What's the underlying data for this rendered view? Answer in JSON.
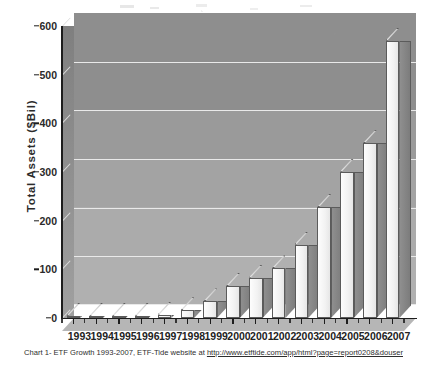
{
  "chart_data": {
    "type": "bar",
    "title": "",
    "xlabel": "",
    "ylabel": "Total Assets ($Bil)",
    "categories": [
      "1993",
      "1994",
      "1995",
      "1996",
      "1997",
      "1998",
      "1999",
      "2000",
      "2001",
      "2002",
      "2003",
      "2004",
      "2005",
      "2006",
      "2007"
    ],
    "values": [
      0.5,
      0.5,
      1,
      2,
      7,
      16,
      34,
      66,
      83,
      102,
      151,
      228,
      301,
      359,
      570
    ],
    "ylim": [
      0,
      600
    ],
    "yticks": [
      0,
      100,
      200,
      300,
      400,
      500,
      600
    ],
    "grid": true,
    "legend": false,
    "style": "3d-column",
    "series": [
      {
        "name": "Total Assets",
        "values": [
          0.5,
          0.5,
          1,
          2,
          7,
          16,
          34,
          66,
          83,
          102,
          151,
          228,
          301,
          359,
          570
        ]
      }
    ]
  },
  "axes": {
    "y_title": "Total Assets ($Bil)",
    "y_tick_labels": [
      "0",
      "100",
      "200",
      "300",
      "400",
      "500",
      "600"
    ],
    "x_tick_labels": [
      "1993",
      "1994",
      "1995",
      "1996",
      "1997",
      "1998",
      "1999",
      "2000",
      "2001",
      "2002",
      "2003",
      "2004",
      "2005",
      "2006",
      "2007"
    ]
  },
  "caption": {
    "prefix": "Chart 1- ETF Growth 1993-2007, ETF-Tide website at ",
    "url": "http://www.etftide.com/app/html?page=report0208&douser"
  },
  "colors": {
    "plot_background_top": "#8e8e8e",
    "plot_background_bottom": "#b0b0b0",
    "gridline": "#e9e9e9",
    "bar_face": "#f2f2f2",
    "bar_side": "#8f8f8f",
    "axis": "#1d1d1d",
    "text": "#232323",
    "page_background": "#ffffff"
  }
}
